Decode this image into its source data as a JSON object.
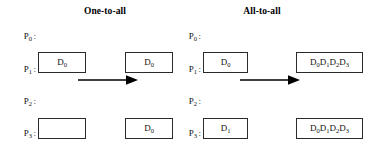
{
  "figure": {
    "caption_panels": [
      "One-to-all",
      "All-to-all"
    ],
    "process_count": 4
  },
  "panels": {
    "one_to_all": {
      "title": "One-to-all",
      "arrow_name": "broadcast-arrow",
      "rows": [
        {
          "label_p": "P",
          "label_sub": "0",
          "label_colon": ":",
          "source": {
            "text": "D",
            "sub": "0",
            "empty": false
          },
          "dest": {
            "text": "D",
            "sub": "0",
            "empty": false
          }
        },
        {
          "label_p": "P",
          "label_sub": "1",
          "label_colon": ":",
          "source": {
            "text": "",
            "sub": "",
            "empty": true
          },
          "dest": {
            "text": "D",
            "sub": "0",
            "empty": false
          }
        },
        {
          "label_p": "P",
          "label_sub": "2",
          "label_colon": ":",
          "source": {
            "text": "",
            "sub": "",
            "empty": true
          },
          "dest": {
            "text": "D",
            "sub": "0",
            "empty": false
          }
        },
        {
          "label_p": "P",
          "label_sub": "3",
          "label_colon": ":",
          "source": {
            "text": "",
            "sub": "",
            "empty": true
          },
          "dest": {
            "text": "D",
            "sub": "0",
            "empty": false
          }
        }
      ]
    },
    "all_to_all": {
      "title": "All-to-all",
      "arrow_name": "allgather-arrow",
      "rows": [
        {
          "label_p": "P",
          "label_sub": "0",
          "label_colon": ":",
          "source": {
            "text": "D",
            "sub": "0",
            "empty": false
          },
          "dest_items": [
            {
              "text": "D",
              "sub": "0"
            },
            {
              "text": "D",
              "sub": "1"
            },
            {
              "text": "D",
              "sub": "2"
            },
            {
              "text": "D",
              "sub": "3"
            }
          ]
        },
        {
          "label_p": "P",
          "label_sub": "1",
          "label_colon": ":",
          "source": {
            "text": "D",
            "sub": "1",
            "empty": false
          },
          "dest_items": [
            {
              "text": "D",
              "sub": "0"
            },
            {
              "text": "D",
              "sub": "1"
            },
            {
              "text": "D",
              "sub": "2"
            },
            {
              "text": "D",
              "sub": "3"
            }
          ]
        },
        {
          "label_p": "P",
          "label_sub": "2",
          "label_colon": ":",
          "source": {
            "text": "D",
            "sub": "2",
            "empty": false
          },
          "dest_items": [
            {
              "text": "D",
              "sub": "0"
            },
            {
              "text": "D",
              "sub": "1"
            },
            {
              "text": "D",
              "sub": "2"
            },
            {
              "text": "D",
              "sub": "3"
            }
          ]
        },
        {
          "label_p": "P",
          "label_sub": "3",
          "label_colon": ":",
          "source": {
            "text": "D",
            "sub": "3",
            "empty": false
          },
          "dest_items": [
            {
              "text": "D",
              "sub": "0"
            },
            {
              "text": "D",
              "sub": "1"
            },
            {
              "text": "D",
              "sub": "2"
            },
            {
              "text": "D",
              "sub": "3"
            }
          ]
        }
      ]
    }
  },
  "colors": {
    "background": "#ffffff",
    "box_border": "#2b2b2b",
    "text": "#111111",
    "arrow": "#000000"
  }
}
